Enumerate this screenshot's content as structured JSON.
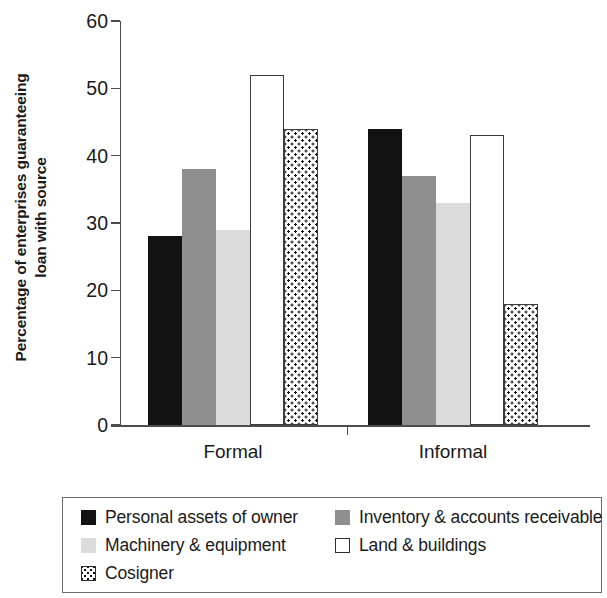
{
  "chart_data": {
    "type": "bar",
    "title": "",
    "subtitle": "",
    "xlabel": "",
    "ylabel": "Percentage of enterprises guaranteeing loan with source",
    "ylabel_line1": "Percentage of enterprises guaranteeing",
    "ylabel_line2": "loan with source",
    "categories": [
      "Formal",
      "Informal"
    ],
    "ylim": [
      0,
      60
    ],
    "yticks": [
      0,
      10,
      20,
      30,
      40,
      50,
      60
    ],
    "ytick_labels": [
      "0",
      "10",
      "20",
      "30",
      "40",
      "50",
      "60"
    ],
    "grid": false,
    "legend_position": "bottom",
    "series": [
      {
        "name": "Personal assets of owner",
        "values": [
          28,
          44
        ],
        "color": "#121212",
        "pattern": "solid"
      },
      {
        "name": "Inventory & accounts receivable",
        "values": [
          38,
          37
        ],
        "color": "#8f8f8f",
        "pattern": "solid"
      },
      {
        "name": "Machinery & equipment",
        "values": [
          29,
          33
        ],
        "color": "#dcdcdc",
        "pattern": "solid"
      },
      {
        "name": "Land & buildings",
        "values": [
          52,
          43
        ],
        "color": "#ffffff",
        "pattern": "outline"
      },
      {
        "name": "Cosigner",
        "values": [
          44,
          18
        ],
        "color": "#ffffff",
        "pattern": "checkered"
      }
    ]
  },
  "legend": {
    "items": [
      {
        "label": "Personal assets of owner"
      },
      {
        "label": "Inventory & accounts receivable"
      },
      {
        "label": "Machinery & equipment"
      },
      {
        "label": "Land & buildings"
      },
      {
        "label": "Cosigner"
      }
    ]
  },
  "axis": {
    "y_title_line1": "Percentage of enterprises guaranteeing",
    "y_title_line2": "loan with source",
    "x_categories": [
      "Formal",
      "Informal"
    ],
    "y_tick_labels": [
      "60",
      "50",
      "40",
      "30",
      "20",
      "10",
      "0"
    ]
  }
}
